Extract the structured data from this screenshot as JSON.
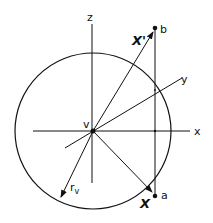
{
  "diagram": {
    "labels": {
      "z_axis": "z",
      "x_axis": "x",
      "y_axis": "y",
      "center": "v",
      "radius": "r",
      "radius_sub": "v",
      "vector_x": "X",
      "vector_x_prime": "X'",
      "point_a": "a",
      "point_b": "b"
    },
    "colors": {
      "stroke": "#111111",
      "background": "#ffffff"
    }
  }
}
